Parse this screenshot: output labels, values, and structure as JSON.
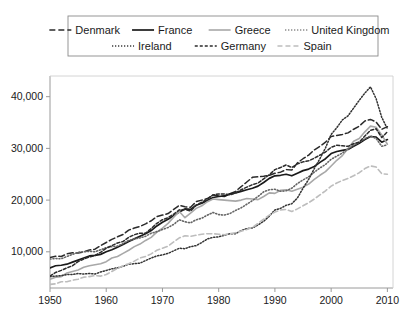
{
  "chart_data": {
    "type": "line",
    "title": "",
    "subtitle": "",
    "xlabel": "",
    "ylabel": "",
    "xlim": [
      1950,
      2011
    ],
    "ylim": [
      3000,
      44000
    ],
    "grid": false,
    "legend_position": "top",
    "x_ticks": [
      1950,
      1960,
      1970,
      1980,
      1990,
      2000,
      2010
    ],
    "x_tick_labels": [
      "1950",
      "1960",
      "1970",
      "1980",
      "1990",
      "2000",
      "2010"
    ],
    "y_ticks": [
      10000,
      20000,
      30000,
      40000
    ],
    "y_tick_labels": [
      "10,000",
      "20,000",
      "30,000",
      "40,000"
    ],
    "x": [
      1950,
      1951,
      1952,
      1953,
      1954,
      1955,
      1956,
      1957,
      1958,
      1959,
      1960,
      1961,
      1962,
      1963,
      1964,
      1965,
      1966,
      1967,
      1968,
      1969,
      1970,
      1971,
      1972,
      1973,
      1974,
      1975,
      1976,
      1977,
      1978,
      1979,
      1980,
      1981,
      1982,
      1983,
      1984,
      1985,
      1986,
      1987,
      1988,
      1989,
      1990,
      1991,
      1992,
      1993,
      1994,
      1995,
      1996,
      1997,
      1998,
      1999,
      2000,
      2001,
      2002,
      2003,
      2004,
      2005,
      2006,
      2007,
      2008,
      2009,
      2010
    ],
    "series": [
      {
        "name": "Denmark",
        "color": "#2b2b2b",
        "dash": "6,3",
        "width": 1.5,
        "values": [
          8900,
          9150,
          9100,
          9600,
          9800,
          9750,
          10000,
          10350,
          10500,
          11200,
          11800,
          12400,
          12900,
          13350,
          14200,
          14600,
          14900,
          15400,
          16000,
          16800,
          17100,
          17400,
          18200,
          19000,
          18700,
          18600,
          19700,
          20000,
          20300,
          21000,
          20800,
          20700,
          21200,
          21700,
          22600,
          23500,
          24400,
          24500,
          24600,
          24800,
          25200,
          25400,
          25900,
          25800,
          27200,
          28000,
          28700,
          29700,
          30400,
          31200,
          32300,
          32500,
          32700,
          33000,
          33700,
          34300,
          35300,
          35600,
          35100,
          33700,
          34200
        ]
      },
      {
        "name": "France",
        "color": "#1a1a1a",
        "dash": "",
        "width": 1.7,
        "values": [
          6900,
          7300,
          7400,
          7600,
          8000,
          8400,
          8800,
          9200,
          9300,
          9500,
          10000,
          10400,
          10900,
          11400,
          12000,
          12500,
          13000,
          13500,
          14100,
          15000,
          15700,
          16300,
          17000,
          17700,
          18300,
          18200,
          19000,
          19400,
          19900,
          20500,
          20700,
          20800,
          21200,
          21400,
          21700,
          22000,
          22300,
          22700,
          23400,
          24200,
          24700,
          24800,
          25000,
          24700,
          25200,
          25700,
          26000,
          26500,
          27300,
          28000,
          29000,
          29400,
          29600,
          29800,
          30400,
          31000,
          31700,
          32300,
          32200,
          31200,
          31700
        ]
      },
      {
        "name": "Greece",
        "color": "#a8a8a8",
        "dash": "",
        "width": 1.6,
        "values": [
          4700,
          5100,
          5200,
          5900,
          6200,
          6500,
          7000,
          7300,
          7500,
          7700,
          8100,
          8800,
          9100,
          9700,
          10300,
          11000,
          11500,
          12200,
          12800,
          13800,
          14600,
          15500,
          16700,
          17800,
          16600,
          17500,
          18400,
          18900,
          19700,
          20200,
          20100,
          20000,
          19900,
          19800,
          20000,
          20300,
          20200,
          20100,
          20700,
          21400,
          21300,
          21900,
          22000,
          21700,
          22100,
          22500,
          23100,
          24000,
          24800,
          25500,
          26600,
          27700,
          28600,
          30000,
          31400,
          31900,
          33200,
          34300,
          34100,
          32600,
          30800
        ]
      },
      {
        "name": "United Kingdom",
        "color": "#666666",
        "dash": "1,2",
        "width": 1.6,
        "values": [
          8600,
          8700,
          8650,
          9100,
          9500,
          9900,
          10000,
          10100,
          10000,
          10400,
          10800,
          11000,
          11100,
          11600,
          12200,
          12500,
          12700,
          13000,
          13600,
          13900,
          14300,
          14700,
          15300,
          16200,
          15800,
          15600,
          16200,
          16500,
          17100,
          17600,
          17200,
          17100,
          17400,
          18000,
          18500,
          19200,
          19900,
          20700,
          21600,
          22000,
          22100,
          21700,
          21800,
          22300,
          23200,
          23900,
          24500,
          25400,
          26200,
          26900,
          27900,
          28500,
          29100,
          29900,
          30600,
          31200,
          31900,
          32400,
          31900,
          30400,
          30700
        ]
      },
      {
        "name": "Ireland",
        "color": "#333333",
        "dash": "1.2,1.8",
        "width": 1.5,
        "values": [
          5200,
          5300,
          5400,
          5600,
          5600,
          5800,
          5700,
          5800,
          5700,
          6100,
          6400,
          6700,
          6900,
          7200,
          7600,
          7700,
          7800,
          8300,
          8800,
          9200,
          9400,
          9700,
          10200,
          10700,
          10600,
          11000,
          11200,
          11800,
          12500,
          12800,
          12900,
          13200,
          13500,
          13500,
          14100,
          14500,
          14600,
          15200,
          15900,
          16900,
          18100,
          18400,
          19000,
          19300,
          20400,
          22300,
          24000,
          26100,
          28000,
          30100,
          32700,
          34000,
          35500,
          36300,
          37800,
          39300,
          40700,
          41900,
          39600,
          36000,
          33800
        ]
      },
      {
        "name": "Germany",
        "color": "#2b2b2b",
        "dash": "3,2",
        "width": 1.5,
        "values": [
          5300,
          6000,
          6400,
          6900,
          7300,
          8100,
          8600,
          9000,
          9300,
          9900,
          10700,
          11200,
          11700,
          12000,
          12800,
          13300,
          13600,
          13600,
          14500,
          15500,
          16200,
          16600,
          17300,
          18100,
          18200,
          17900,
          19000,
          19600,
          20200,
          21000,
          21200,
          21200,
          21000,
          21400,
          22000,
          22500,
          23000,
          23300,
          24100,
          24900,
          25900,
          26300,
          26800,
          26300,
          27000,
          27400,
          27600,
          28100,
          28700,
          29300,
          30200,
          30600,
          30500,
          30400,
          30900,
          31200,
          32400,
          33500,
          33800,
          32100,
          33200
        ]
      },
      {
        "name": "Spain",
        "color": "#bdbdbd",
        "dash": "5,3",
        "width": 1.6,
        "values": [
          3700,
          3800,
          4200,
          4200,
          4500,
          4700,
          5100,
          5200,
          5400,
          5300,
          5600,
          6200,
          6800,
          7300,
          7700,
          8200,
          8800,
          9100,
          9600,
          10300,
          10700,
          11100,
          11900,
          12700,
          13100,
          13000,
          13200,
          13400,
          13500,
          13500,
          13400,
          13300,
          13500,
          13700,
          14000,
          14300,
          14700,
          15500,
          16300,
          17100,
          17700,
          18100,
          18200,
          17800,
          18300,
          18900,
          19500,
          20200,
          21000,
          21800,
          22700,
          23300,
          23800,
          24200,
          24700,
          25300,
          26100,
          26600,
          26400,
          25100,
          25000
        ]
      }
    ],
    "legend_rows": [
      [
        "Denmark",
        "France",
        "Greece",
        "United Kingdom"
      ],
      [
        "Ireland",
        "Germany",
        "Spain"
      ]
    ]
  },
  "legend": {
    "items": [
      {
        "label": "Denmark",
        "key": "Denmark"
      },
      {
        "label": "France",
        "key": "France"
      },
      {
        "label": "Greece",
        "key": "Greece"
      },
      {
        "label": "United Kingdom",
        "key": "United Kingdom"
      },
      {
        "label": "Ireland",
        "key": "Ireland"
      },
      {
        "label": "Germany",
        "key": "Germany"
      },
      {
        "label": "Spain",
        "key": "Spain"
      }
    ]
  }
}
